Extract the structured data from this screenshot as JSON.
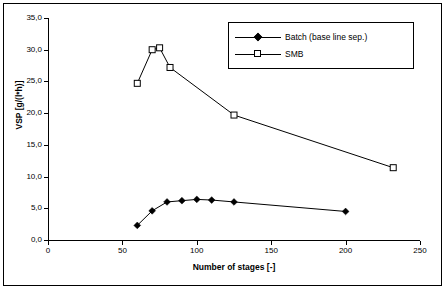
{
  "chart_data": {
    "type": "line",
    "title": "",
    "xlabel": "Number of stages [-]",
    "ylabel": "VSP [g/(l*h)]",
    "xlim": [
      0,
      250
    ],
    "ylim": [
      0.0,
      35.0
    ],
    "xticks": [
      0,
      50,
      100,
      150,
      200,
      250
    ],
    "xtick_labels": [
      "0",
      "50",
      "100",
      "150",
      "200",
      "250"
    ],
    "yticks": [
      0.0,
      5.0,
      10.0,
      15.0,
      20.0,
      25.0,
      30.0,
      35.0
    ],
    "ytick_labels": [
      "0,0",
      "5,0",
      "10,0",
      "15,0",
      "20,0",
      "25,0",
      "30,0",
      "35,0"
    ],
    "grid": false,
    "legend_position": "top-right",
    "series": [
      {
        "name": "Batch (base line sep.)",
        "marker": "filled-diamond",
        "color": "#000000",
        "x": [
          60,
          70,
          80,
          90,
          100,
          110,
          125,
          200
        ],
        "y": [
          2.3,
          4.6,
          6.0,
          6.2,
          6.4,
          6.3,
          6.0,
          4.5
        ]
      },
      {
        "name": "SMB",
        "marker": "open-square",
        "color": "#000000",
        "x": [
          60,
          70,
          75,
          82,
          125,
          232
        ],
        "y": [
          24.7,
          30.0,
          30.3,
          27.2,
          19.7,
          11.4
        ]
      }
    ],
    "legend": [
      {
        "label": "Batch (base line sep.)",
        "marker": "filled-diamond"
      },
      {
        "label": "SMB",
        "marker": "open-square"
      }
    ]
  }
}
